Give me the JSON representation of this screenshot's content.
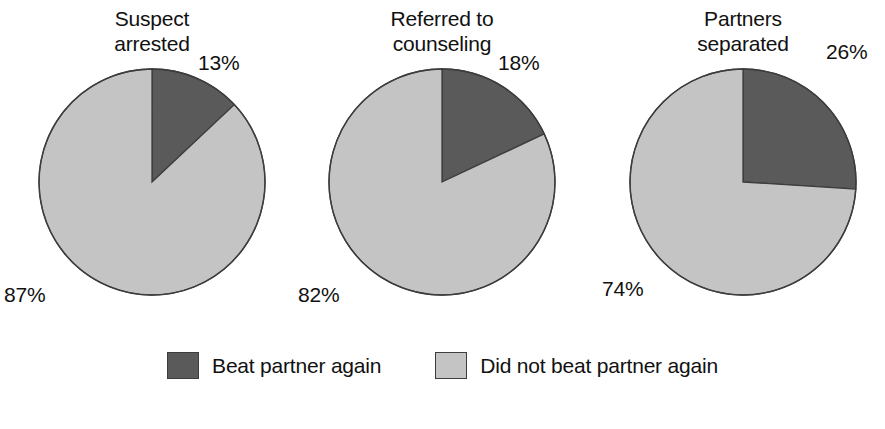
{
  "chart_data": {
    "type": "pie",
    "title": "",
    "subtitle": "",
    "xlabel": "",
    "ylabel": "",
    "legend_position": "bottom",
    "grid": false,
    "slice_colors": {
      "beat_again": "#5a5a5a",
      "did_not_beat_again": "#c4c4c4",
      "outline": "#3d3d3d",
      "background": "#ffffff",
      "text": "#111111"
    },
    "legend": [
      {
        "label": "Beat partner again",
        "color": "#5a5a5a",
        "swatch_name": "legend-swatch-beat-again"
      },
      {
        "label": "Did not beat partner again",
        "color": "#c4c4c4",
        "swatch_name": "legend-swatch-did-not-beat-again"
      }
    ],
    "categories": [
      "Beat partner again",
      "Did not beat partner again"
    ],
    "charts": [
      {
        "title": "Suspect\narrested",
        "title_line1": "Suspect",
        "title_line2": "arrested",
        "values": [
          13,
          87
        ],
        "labels": [
          "13%",
          "87%"
        ],
        "dark_label": "13%",
        "light_label": "87%"
      },
      {
        "title": "Referred to\ncounseling",
        "title_line1": "Referred to",
        "title_line2": "counseling",
        "values": [
          18,
          82
        ],
        "labels": [
          "18%",
          "82%"
        ],
        "dark_label": "18%",
        "light_label": "82%"
      },
      {
        "title": "Partners\nseparated",
        "title_line1": "Partners",
        "title_line2": "separated",
        "values": [
          26,
          74
        ],
        "labels": [
          "26%",
          "74%"
        ],
        "dark_label": "26%",
        "light_label": "74%"
      }
    ]
  }
}
